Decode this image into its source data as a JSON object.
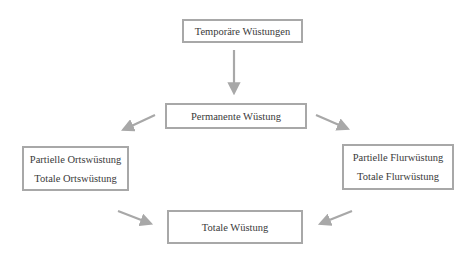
{
  "diagram": {
    "nodes": {
      "temporary": {
        "label": "Temporäre Wüstungen"
      },
      "permanent": {
        "label": "Permanente Wüstung"
      },
      "settlement": {
        "lines": [
          "Partielle Ortswüstung",
          "Totale Ortswüstung"
        ]
      },
      "field": {
        "lines": [
          "Partielle Flurwüstung",
          "Totale Flurwüstung"
        ]
      },
      "total": {
        "label": "Totale Wüstung"
      }
    },
    "edges": [
      {
        "from": "temporary",
        "to": "permanent"
      },
      {
        "from": "permanent",
        "to": "settlement"
      },
      {
        "from": "permanent",
        "to": "field"
      },
      {
        "from": "settlement",
        "to": "total"
      },
      {
        "from": "field",
        "to": "total"
      }
    ],
    "colors": {
      "border": "#a8a8a8",
      "arrow": "#a8a8a8",
      "text": "#3a3a3a",
      "background": "#ffffff"
    }
  }
}
